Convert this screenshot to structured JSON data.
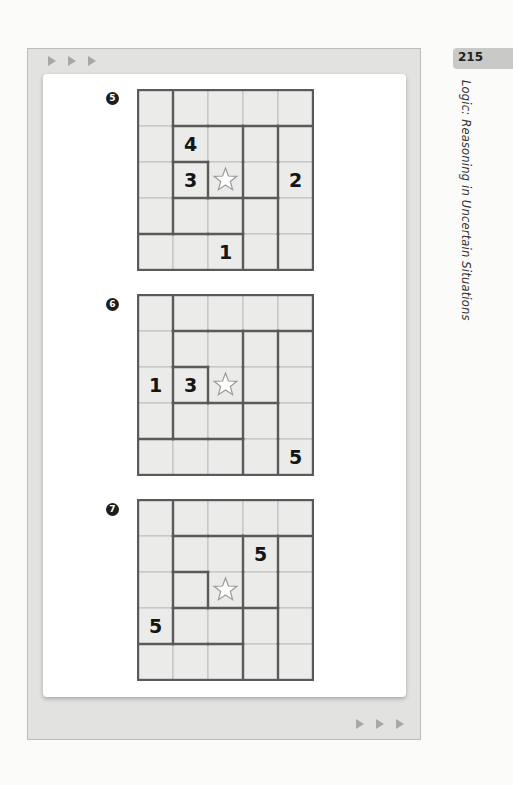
{
  "page": {
    "page_number": "215",
    "running_title": "Logic: Reasoning in Uncertain Situations"
  },
  "colors": {
    "frame": "#e2e2e1",
    "cell": "#ebebea",
    "thin_line": "#bdbdbd",
    "thick_line": "#5a5a5a",
    "badge": "#1e1e1e"
  },
  "decor": {
    "top_arrows": [
      "arrow-right",
      "arrow-right",
      "arrow-right"
    ],
    "bottom_arrows": [
      "arrow-right",
      "arrow-right",
      "arrow-right"
    ]
  },
  "region_layout": {
    "description": "5x5 grid; thick borders divide cells into regions. Same layout in all three puzzles.",
    "regions": [
      [
        [
          0,
          0
        ],
        [
          1,
          0
        ],
        [
          2,
          0
        ],
        [
          3,
          0
        ],
        [
          4,
          0
        ]
      ],
      [
        [
          0,
          1
        ],
        [
          0,
          2
        ],
        [
          0,
          3
        ],
        [
          0,
          4
        ]
      ],
      [
        [
          1,
          1
        ],
        [
          1,
          2
        ],
        [
          2,
          2
        ],
        [
          3,
          2
        ],
        [
          3,
          1
        ]
      ],
      [
        [
          1,
          3
        ],
        [
          2,
          3
        ],
        [
          2,
          4
        ]
      ],
      [
        [
          2,
          1
        ],
        [
          3,
          3
        ]
      ]
    ],
    "cell_regions": [
      [
        "A",
        "B",
        "B",
        "B",
        "B"
      ],
      [
        "A",
        "C",
        "C",
        "D",
        "E"
      ],
      [
        "A",
        "F",
        "C",
        "D",
        "E"
      ],
      [
        "A",
        "G",
        "G",
        "H",
        "E"
      ],
      [
        "I",
        "I",
        "I",
        "H",
        "E"
      ]
    ]
  },
  "puzzles": [
    {
      "label": "5",
      "star": [
        2,
        2
      ],
      "clues": [
        {
          "row": 1,
          "col": 1,
          "value": "4"
        },
        {
          "row": 2,
          "col": 1,
          "value": "3"
        },
        {
          "row": 2,
          "col": 4,
          "value": "2"
        },
        {
          "row": 4,
          "col": 2,
          "value": "1"
        }
      ]
    },
    {
      "label": "6",
      "star": [
        2,
        2
      ],
      "clues": [
        {
          "row": 2,
          "col": 0,
          "value": "1"
        },
        {
          "row": 2,
          "col": 1,
          "value": "3"
        },
        {
          "row": 4,
          "col": 4,
          "value": "5"
        }
      ]
    },
    {
      "label": "7",
      "star": [
        2,
        2
      ],
      "clues": [
        {
          "row": 1,
          "col": 3,
          "value": "5"
        },
        {
          "row": 3,
          "col": 0,
          "value": "5"
        }
      ]
    }
  ]
}
